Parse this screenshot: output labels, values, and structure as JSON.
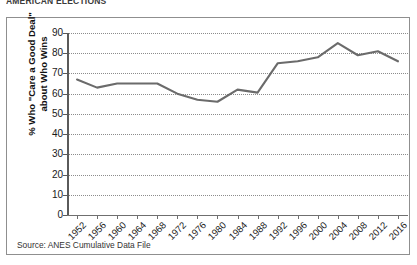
{
  "top_caption": "AMERICAN ELECTIONS",
  "source_note": "Source: ANES Cumulative Data File",
  "axis": {
    "y_title_line1": "% Who \"Care a Good Deal\"",
    "y_title_line2": "about Who Wins",
    "y_ticks": [
      "90",
      "80",
      "70",
      "60",
      "50",
      "40",
      "30",
      "20",
      "10",
      "0"
    ]
  },
  "chart_data": {
    "type": "line",
    "title": "",
    "subtitle": "",
    "xlabel": "",
    "ylabel": "% Who \"Care a Good Deal\" about Who Wins",
    "ylim": [
      0,
      90
    ],
    "ytick_step": 10,
    "grid": true,
    "legend": "none",
    "line_color": "#6b6b6b",
    "categories": [
      "1952",
      "1956",
      "1960",
      "1964",
      "1968",
      "1972",
      "1976",
      "1980",
      "1984",
      "1988",
      "1992",
      "1996",
      "2000",
      "2004",
      "2008",
      "2012",
      "2016"
    ],
    "values": [
      67,
      63,
      65,
      65,
      65,
      60,
      57,
      56,
      62,
      60.5,
      75,
      76,
      78,
      85,
      79,
      81,
      76
    ],
    "series": [
      {
        "name": "% Who \"Care a Good Deal\" about Who Wins",
        "values": [
          67,
          63,
          65,
          65,
          65,
          60,
          57,
          56,
          62,
          60.5,
          75,
          76,
          78,
          85,
          79,
          81,
          76
        ]
      }
    ]
  }
}
